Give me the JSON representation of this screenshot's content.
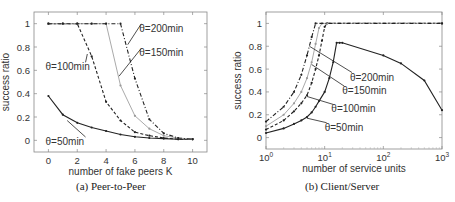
{
  "chart_data": [
    {
      "type": "line",
      "caption": "(a) Peer-to-Peer",
      "xlabel": "number of fake peers K",
      "ylabel": "success ratio",
      "xscale": "linear",
      "xlim": [
        -1,
        11
      ],
      "ylim": [
        -0.1,
        1.1
      ],
      "xticks": [
        0,
        2,
        4,
        6,
        8,
        10
      ],
      "xtick_labels": [
        "0",
        "2",
        "4",
        "6",
        "8",
        "10"
      ],
      "yticks": [
        0,
        0.2,
        0.4,
        0.6,
        0.8,
        1
      ],
      "ytick_labels": [
        "0",
        "0.2",
        "0.4",
        "0.6",
        "0.8",
        "1"
      ],
      "grid": false,
      "series": [
        {
          "name": "θ=50min",
          "style": "solid",
          "color": "#222222",
          "x": [
            0,
            1,
            2,
            3,
            4,
            5,
            6,
            7,
            8,
            9,
            10
          ],
          "y": [
            0.38,
            0.22,
            0.15,
            0.11,
            0.08,
            0.05,
            0.03,
            0.02,
            0.015,
            0.01,
            0.01
          ]
        },
        {
          "name": "θ=100min",
          "style": "dashed",
          "color": "#222222",
          "x": [
            0,
            1,
            2,
            3,
            4,
            5,
            6,
            7,
            8,
            9,
            10
          ],
          "y": [
            1,
            1,
            1,
            0.72,
            0.33,
            0.17,
            0.07,
            0.04,
            0.02,
            0.01,
            0.01
          ]
        },
        {
          "name": "θ=150min",
          "style": "dotted-light",
          "color": "#aaaaaa",
          "x": [
            0,
            1,
            2,
            3,
            4,
            5,
            6,
            7,
            8,
            9,
            10
          ],
          "y": [
            1,
            1,
            1,
            1,
            1,
            0.47,
            0.21,
            0.1,
            0.04,
            0.02,
            0.01
          ]
        },
        {
          "name": "θ=200min",
          "style": "dashdot",
          "color": "#222222",
          "x": [
            0,
            1,
            2,
            3,
            4,
            5,
            6,
            7,
            8,
            9,
            10
          ],
          "y": [
            1,
            1,
            1,
            1,
            1,
            1,
            0.53,
            0.18,
            0.06,
            0.02,
            0.01
          ]
        }
      ],
      "annotations": [
        {
          "text": "θ=200min",
          "x": 6.3,
          "y": 0.93,
          "arrow_to": [
            5.5,
            0.82
          ]
        },
        {
          "text": "θ=150min",
          "x": 6.3,
          "y": 0.72,
          "arrow_to": [
            4.9,
            0.55
          ]
        },
        {
          "text": "θ=100min",
          "x": -0.2,
          "y": 0.6,
          "arrow_to": [
            2.7,
            0.74
          ]
        },
        {
          "text": "θ=50min",
          "x": -0.2,
          "y": -0.04,
          "arrow_to": [
            1.3,
            0.17
          ]
        }
      ]
    },
    {
      "type": "line",
      "caption": "(b) Client/Server",
      "xlabel": "number of service units",
      "ylabel": "success ratio",
      "xscale": "log",
      "xlim": [
        1,
        1000
      ],
      "ylim": [
        -0.1,
        1.1
      ],
      "xticks": [
        1,
        10,
        100,
        1000
      ],
      "xtick_labels": [
        "10",
        "10",
        "10",
        "10"
      ],
      "xtick_exponents": [
        "0",
        "1",
        "2",
        "3"
      ],
      "yticks": [
        0,
        0.2,
        0.4,
        0.6,
        0.8,
        1
      ],
      "ytick_labels": [
        "0",
        "0.2",
        "0.4",
        "0.6",
        "0.8",
        "1"
      ],
      "grid": false,
      "series": [
        {
          "name": "θ=50min",
          "style": "solid",
          "color": "#222222",
          "x": [
            1,
            2,
            3,
            4,
            5,
            6,
            7,
            8,
            10,
            12,
            14,
            16,
            18,
            20,
            100,
            200,
            500,
            1000
          ],
          "y": [
            0.04,
            0.08,
            0.12,
            0.15,
            0.18,
            0.22,
            0.27,
            0.32,
            0.4,
            0.52,
            0.66,
            0.83,
            0.83,
            0.83,
            0.72,
            0.65,
            0.5,
            0.24
          ]
        },
        {
          "name": "θ=100min",
          "style": "dashed",
          "color": "#222222",
          "x": [
            1,
            2,
            3,
            4,
            5,
            6,
            7,
            8,
            9,
            10,
            11,
            1000
          ],
          "y": [
            0.07,
            0.15,
            0.23,
            0.3,
            0.37,
            0.48,
            0.6,
            0.72,
            0.85,
            0.97,
            1,
            1
          ]
        },
        {
          "name": "θ=150min",
          "style": "dotted-light",
          "color": "#aaaaaa",
          "x": [
            1,
            2,
            3,
            4,
            5,
            6,
            7,
            8,
            9,
            1000
          ],
          "y": [
            0.1,
            0.2,
            0.3,
            0.4,
            0.52,
            0.66,
            0.82,
            0.96,
            1,
            1
          ]
        },
        {
          "name": "θ=200min",
          "style": "dashdot",
          "color": "#222222",
          "x": [
            1,
            2,
            3,
            4,
            5,
            6,
            7,
            1000
          ],
          "y": [
            0.14,
            0.27,
            0.4,
            0.55,
            0.72,
            0.88,
            1,
            1
          ]
        }
      ],
      "annotations": [
        {
          "text": "θ=200min",
          "x": 27,
          "y": 0.5,
          "arrow_to": [
            5.5,
            0.8
          ]
        },
        {
          "text": "θ=150min",
          "x": 20,
          "y": 0.38,
          "arrow_to": [
            6,
            0.64
          ]
        },
        {
          "text": "θ=100min",
          "x": 13,
          "y": 0.22,
          "arrow_to": [
            5,
            0.36
          ]
        },
        {
          "text": "θ=50min",
          "x": 10,
          "y": 0.06,
          "arrow_to": [
            5,
            0.17
          ]
        }
      ]
    }
  ]
}
